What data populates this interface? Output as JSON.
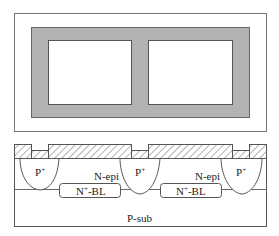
{
  "diagram": {
    "type": "semiconductor-isolation-structure",
    "top_view": {
      "description": "plan view of two isolated islands surrounded by isolation ring",
      "colors": {
        "frame": "#777777",
        "isolation": "#b0b0b0",
        "island": "#ffffff"
      }
    },
    "cross_section": {
      "labels": {
        "p_plus_left": "P",
        "p_plus_mid": "P",
        "p_plus_right": "P",
        "p_plus_sup": "+",
        "n_epi_left": "N-epi",
        "n_epi_right": "N-epi",
        "bl_left": "-BL",
        "bl_right": "-BL",
        "bl_prefix": "N",
        "bl_sup": "+",
        "substrate": "P-sub"
      },
      "colors": {
        "line": "#555555",
        "oxide_hatch": "#666666",
        "background": "#ffffff"
      }
    }
  }
}
